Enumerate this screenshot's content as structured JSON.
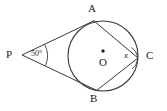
{
  "figure": {
    "stroke_color": "#3a3a3a",
    "text_color": "#222222",
    "background_color": "#ffffff",
    "points": {
      "A": {
        "label": "A",
        "x": 93,
        "y": 21,
        "role": "tangent-point-upper"
      },
      "B": {
        "label": "B",
        "x": 96,
        "y": 91,
        "role": "tangent-point-lower"
      },
      "C": {
        "label": "C",
        "x": 138,
        "y": 58,
        "role": "point-on-circle"
      },
      "O": {
        "label": "O",
        "x": 103,
        "y": 56,
        "role": "circle-center"
      },
      "P": {
        "label": "P",
        "x": 22,
        "y": 55,
        "role": "external-point"
      }
    },
    "circle": {
      "cx": 103,
      "cy": 56,
      "r": 35
    },
    "angles": {
      "at_P": {
        "label": "50°",
        "value": 50,
        "unit": "degrees",
        "vertex": "P"
      },
      "at_C": {
        "label": "x",
        "value": null,
        "unit": "degrees",
        "vertex": "C"
      }
    },
    "segments": [
      {
        "name": "PA",
        "from": "P",
        "to": "A",
        "kind": "tangent"
      },
      {
        "name": "PB",
        "from": "P",
        "to": "B",
        "kind": "tangent"
      },
      {
        "name": "AC",
        "from": "A",
        "to": "C",
        "kind": "chord"
      },
      {
        "name": "BC",
        "from": "B",
        "to": "C",
        "kind": "chord"
      }
    ]
  }
}
